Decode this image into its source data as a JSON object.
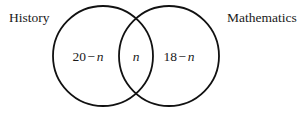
{
  "figure": {
    "type": "venn-diagram",
    "background_color": "#ffffff",
    "stroke_color": "#111111",
    "stroke_width": 1.8,
    "width": 302,
    "height": 114
  },
  "sets": [
    {
      "id": "history",
      "label": "History",
      "center_x": 103,
      "center_y": 56,
      "radius": 50
    },
    {
      "id": "mathematics",
      "label": "Mathematics",
      "center_x": 169,
      "center_y": 56,
      "radius": 50
    }
  ],
  "regions": [
    {
      "id": "left-only",
      "description": "History only",
      "value": "20 − n",
      "number": "20",
      "operator": "−",
      "variable": "n"
    },
    {
      "id": "intersection",
      "description": "History and Mathematics",
      "value": "n",
      "number": "",
      "operator": "",
      "variable": "n"
    },
    {
      "id": "right-only",
      "description": "Mathematics only",
      "value": "18 − n",
      "number": "18",
      "operator": "−",
      "variable": "n"
    }
  ]
}
